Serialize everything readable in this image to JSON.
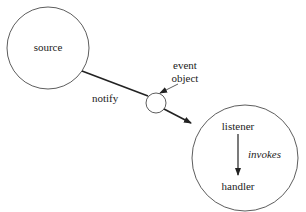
{
  "diagram": {
    "nodes": {
      "source": {
        "label": "source"
      },
      "event_object": {
        "label_line1": "event",
        "label_line2": "object"
      },
      "listener": {
        "label": "listener"
      },
      "handler": {
        "label": "handler"
      }
    },
    "edges": {
      "notify": {
        "label": "notify"
      },
      "invokes": {
        "label": "invokes"
      }
    }
  }
}
